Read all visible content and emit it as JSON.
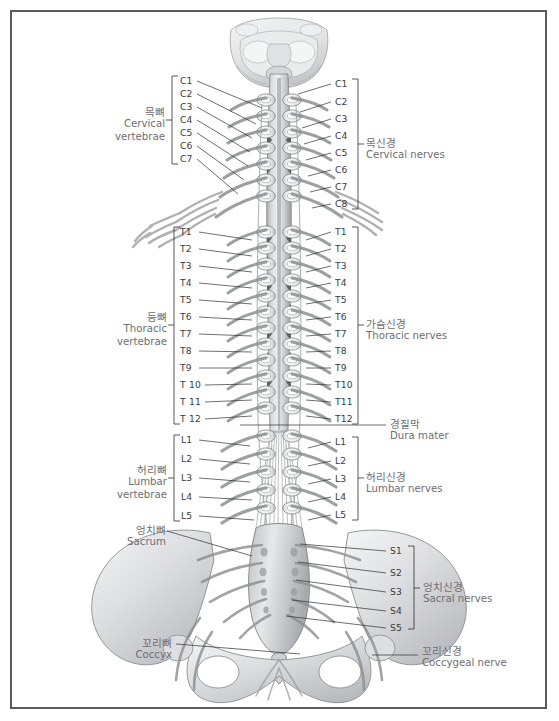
{
  "figure": {
    "border_color": "#5a5a5e",
    "background_color": "#ffffff",
    "label_color": "#6e6e72",
    "segment_label_color": "#3c3c40"
  },
  "groups": {
    "cervical_vertebrae": {
      "kr": "목뼈",
      "en": "Cervical",
      "en2": "vertebrae"
    },
    "thoracic_vertebrae": {
      "kr": "등뼈",
      "en": "Thoracic",
      "en2": "vertebrae"
    },
    "lumbar_vertebrae": {
      "kr": "허리뼈",
      "en": "Lumbar",
      "en2": "vertebrae"
    },
    "sacrum": {
      "kr": "엉치뼈",
      "en": "Sacrum"
    },
    "coccyx": {
      "kr": "꼬리뼈",
      "en": "Coccyx"
    },
    "cervical_nerves": {
      "kr": "목신경",
      "en": "Cervical nerves"
    },
    "thoracic_nerves": {
      "kr": "가슴신경",
      "en": "Thoracic nerves"
    },
    "dura_mater": {
      "kr": "경질막",
      "en": "Dura mater"
    },
    "lumbar_nerves": {
      "kr": "허리신경",
      "en": "Lumbar nerves"
    },
    "sacral_nerves": {
      "kr": "엉치신경",
      "en": "Sacral nerves"
    },
    "coccygeal_nerve": {
      "kr": "꼬리신경",
      "en": "Coccygeal nerve"
    }
  },
  "left_segments": {
    "cervical": [
      "C1",
      "C2",
      "C3",
      "C4",
      "C5",
      "C6",
      "C7"
    ],
    "thoracic": [
      "T1",
      "T2",
      "T3",
      "T4",
      "T5",
      "T6",
      "T7",
      "T8",
      "T9",
      "T 10",
      "T 11",
      "T 12"
    ],
    "lumbar": [
      "L1",
      "L2",
      "L3",
      "L4",
      "L5"
    ]
  },
  "right_segments": {
    "cervical": [
      "C1",
      "C2",
      "C3",
      "C4",
      "C5",
      "C6",
      "C7",
      "C8"
    ],
    "thoracic": [
      "T1",
      "T2",
      "T3",
      "T4",
      "T5",
      "T6",
      "T7",
      "T8",
      "T9",
      "T10",
      "T11",
      "T12"
    ],
    "lumbar": [
      "L1",
      "L2",
      "L3",
      "L4",
      "L5"
    ],
    "sacral": [
      "S1",
      "S2",
      "S3",
      "S4",
      "S5"
    ]
  }
}
